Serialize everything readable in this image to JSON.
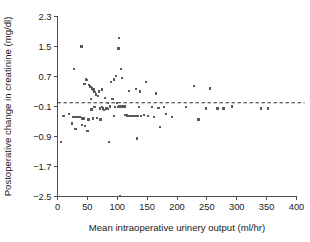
{
  "chart_data": {
    "type": "scatter",
    "title": "",
    "xlabel": "Mean intraoperative urinery output (ml/hr)",
    "ylabel": "Postoperative change in creatinine (mg/dl)",
    "xlim": [
      0,
      400
    ],
    "ylim": [
      -2.5,
      2.3
    ],
    "xticks": [
      0,
      50,
      100,
      150,
      200,
      250,
      300,
      350,
      400
    ],
    "yticks": [
      -2.5,
      -1.7,
      -0.9,
      -0.1,
      0.7,
      1.5,
      2.3
    ],
    "xtick_labels": [
      "0",
      "50",
      "100",
      "150",
      "200",
      "250",
      "300",
      "350",
      "400"
    ],
    "ytick_labels": [
      "−2.5",
      "−1.7",
      "−0.9",
      "−0.1",
      "0.7",
      "1.5",
      "2.3"
    ],
    "grid": false,
    "legend": "none",
    "marker": "square",
    "marker_color": "#5a5a5a",
    "reference_line": {
      "type": "horizontal-dashed",
      "y": 0.0,
      "label": "",
      "color": "#2b2b2b",
      "style": "dashed"
    },
    "points": [
      [
        6,
        -1.05
      ],
      [
        10,
        -0.35
      ],
      [
        19,
        -0.3
      ],
      [
        24,
        -0.55
      ],
      [
        27,
        -0.38
      ],
      [
        28,
        0.9
      ],
      [
        30,
        -0.7
      ],
      [
        32,
        -0.38
      ],
      [
        34,
        -0.38
      ],
      [
        36,
        -0.38
      ],
      [
        38,
        -0.38
      ],
      [
        40,
        1.5
      ],
      [
        41,
        -0.6
      ],
      [
        42,
        -0.42
      ],
      [
        44,
        -0.42
      ],
      [
        45,
        0.5
      ],
      [
        46,
        -0.62
      ],
      [
        48,
        0.62
      ],
      [
        49,
        0.6
      ],
      [
        50,
        -0.75
      ],
      [
        52,
        -0.45
      ],
      [
        53,
        0.48
      ],
      [
        54,
        0.45
      ],
      [
        55,
        0.42
      ],
      [
        56,
        0.1
      ],
      [
        57,
        -0.18
      ],
      [
        58,
        0.38
      ],
      [
        59,
        -0.42
      ],
      [
        60,
        0.35
      ],
      [
        61,
        0.3
      ],
      [
        62,
        -0.12
      ],
      [
        63,
        0.28
      ],
      [
        64,
        0.22
      ],
      [
        65,
        0.2
      ],
      [
        66,
        -0.4
      ],
      [
        68,
        0.18
      ],
      [
        70,
        0.3
      ],
      [
        71,
        -0.15
      ],
      [
        72,
        -0.45
      ],
      [
        74,
        -0.12
      ],
      [
        75,
        0.35
      ],
      [
        76,
        -0.15
      ],
      [
        78,
        -0.2
      ],
      [
        80,
        0.12
      ],
      [
        82,
        -0.15
      ],
      [
        84,
        -0.16
      ],
      [
        85,
        0.0
      ],
      [
        86,
        -1.05
      ],
      [
        88,
        -0.1
      ],
      [
        90,
        0.55
      ],
      [
        92,
        0.1
      ],
      [
        94,
        -0.35
      ],
      [
        95,
        0.62
      ],
      [
        96,
        -0.12
      ],
      [
        98,
        0.72
      ],
      [
        100,
        0.0
      ],
      [
        101,
        -0.12
      ],
      [
        102,
        1.45
      ],
      [
        103,
        1.72
      ],
      [
        104,
        -0.1
      ],
      [
        105,
        -2.48
      ],
      [
        106,
        0.9
      ],
      [
        107,
        -0.1
      ],
      [
        108,
        0.66
      ],
      [
        110,
        -0.1
      ],
      [
        112,
        -0.1
      ],
      [
        114,
        -0.32
      ],
      [
        116,
        -0.34
      ],
      [
        118,
        -0.35
      ],
      [
        120,
        0.32
      ],
      [
        122,
        -0.35
      ],
      [
        124,
        -0.35
      ],
      [
        126,
        -0.35
      ],
      [
        128,
        -0.35
      ],
      [
        130,
        -0.35
      ],
      [
        131,
        0.36
      ],
      [
        132,
        -0.35
      ],
      [
        133,
        -0.95
      ],
      [
        134,
        -0.35
      ],
      [
        136,
        -0.12
      ],
      [
        138,
        0.3
      ],
      [
        140,
        -0.35
      ],
      [
        145,
        -0.32
      ],
      [
        148,
        0.55
      ],
      [
        152,
        -0.35
      ],
      [
        158,
        -0.12
      ],
      [
        162,
        -0.38
      ],
      [
        165,
        0.25
      ],
      [
        168,
        -0.14
      ],
      [
        170,
        -0.14
      ],
      [
        172,
        -0.65
      ],
      [
        178,
        -0.12
      ],
      [
        182,
        -0.3
      ],
      [
        192,
        -0.38
      ],
      [
        215,
        -0.12
      ],
      [
        228,
        0.45
      ],
      [
        236,
        -0.45
      ],
      [
        248,
        -0.15
      ],
      [
        255,
        0.38
      ],
      [
        268,
        -0.15
      ],
      [
        278,
        -0.15
      ],
      [
        292,
        -0.1
      ],
      [
        340,
        -0.15
      ],
      [
        352,
        -0.15
      ]
    ]
  }
}
